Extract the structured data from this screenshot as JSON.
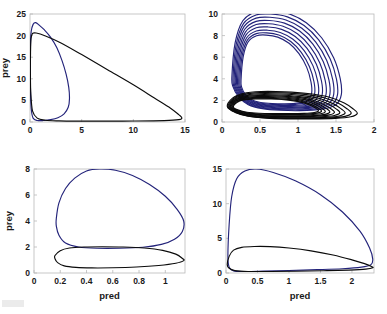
{
  "figure": {
    "title": "",
    "background_color": "#ffffff",
    "blue_color": "#23237a",
    "black_color": "#0b0b0b",
    "axis_color": "#b9b9b9",
    "panel_count": 4,
    "layout": "2x2 grid of predator-prey phase portraits"
  },
  "chart_data": [
    {
      "id": "panel-top-left",
      "type": "line",
      "title": "",
      "xlabel": "",
      "ylabel": "prey",
      "xlim": [
        0,
        15
      ],
      "ylim": [
        0,
        25
      ],
      "xticks": [
        0,
        5,
        10,
        15
      ],
      "xticklabels": [
        "0",
        "5",
        "10",
        "15"
      ],
      "yticks": [
        0,
        5,
        10,
        15,
        20,
        25
      ],
      "yticklabels": [
        "0",
        "5",
        "10",
        "15",
        "20",
        "25"
      ],
      "grid": false,
      "legend": null,
      "series": [
        {
          "name": "blue-orbit",
          "color": "#23237a",
          "description": "narrow tall limit cycle peaking near prey=23 at pred=0.5, extending right to pred~3.8 near prey=3",
          "points": [
            [
              0.05,
              18.5
            ],
            [
              0.12,
              21.0
            ],
            [
              0.3,
              22.6
            ],
            [
              0.55,
              23.0
            ],
            [
              0.9,
              22.4
            ],
            [
              1.4,
              21.3
            ],
            [
              2.0,
              19.6
            ],
            [
              2.6,
              17.2
            ],
            [
              3.1,
              14.2
            ],
            [
              3.5,
              11.0
            ],
            [
              3.75,
              8.0
            ],
            [
              3.82,
              5.4
            ],
            [
              3.7,
              3.4
            ],
            [
              3.3,
              1.9
            ],
            [
              2.7,
              1.0
            ],
            [
              2.0,
              0.55
            ],
            [
              1.3,
              0.35
            ],
            [
              0.7,
              0.35
            ],
            [
              0.3,
              0.9
            ],
            [
              0.12,
              3.0
            ],
            [
              0.05,
              7.0
            ],
            [
              0.03,
              12.0
            ],
            [
              0.05,
              18.5
            ]
          ]
        },
        {
          "name": "black-orbit",
          "color": "#0b0b0b",
          "description": "wide flat limit cycle reaching pred=14.7 near prey=1, upper branch declines linearly from prey=20.6 at pred=0 to prey=1 at pred=14.7",
          "points": [
            [
              0.05,
              16.0
            ],
            [
              0.1,
              19.3
            ],
            [
              0.25,
              20.5
            ],
            [
              0.6,
              20.6
            ],
            [
              1.5,
              19.9
            ],
            [
              3.0,
              18.3
            ],
            [
              5.0,
              15.6
            ],
            [
              7.5,
              12.1
            ],
            [
              10.0,
              8.6
            ],
            [
              12.0,
              5.6
            ],
            [
              13.6,
              3.2
            ],
            [
              14.4,
              1.7
            ],
            [
              14.7,
              0.95
            ],
            [
              14.4,
              0.55
            ],
            [
              13.0,
              0.32
            ],
            [
              10.0,
              0.22
            ],
            [
              7.0,
              0.2
            ],
            [
              4.5,
              0.2
            ],
            [
              2.8,
              0.25
            ],
            [
              1.5,
              0.4
            ],
            [
              0.7,
              0.9
            ],
            [
              0.25,
              2.5
            ],
            [
              0.08,
              6.5
            ],
            [
              0.04,
              11.0
            ],
            [
              0.05,
              16.0
            ]
          ]
        }
      ]
    },
    {
      "id": "panel-top-right",
      "type": "line",
      "title": "",
      "xlabel": "",
      "ylabel": "",
      "xlim": [
        0,
        2
      ],
      "ylim": [
        0,
        10
      ],
      "xticks": [
        0,
        0.5,
        1,
        1.5,
        2
      ],
      "xticklabels": [
        "0",
        "0.5",
        "1",
        "1.5",
        "2"
      ],
      "yticks": [
        0,
        2,
        4,
        6,
        8,
        10
      ],
      "yticklabels": [
        "0",
        "2",
        "4",
        "6",
        "8",
        "10"
      ],
      "grid": false,
      "legend": null,
      "note": "transient spiral: many nested orbits converging; blue family large amplitude (prey up to ~10.3), black family small amplitude (prey 0.3-2.8)",
      "series": [
        {
          "name": "blue-spiral-family",
          "color": "#23237a",
          "orbit_count": 9,
          "description": "nested loops shrinking inward, outermost peaks prey=10.3 at pred=0.55, rightmost pred=1.55",
          "orbits": [
            {
              "peak_prey": 10.3,
              "min_prey": 1.05,
              "left_pred": 0.13,
              "right_pred": 1.57
            },
            {
              "peak_prey": 10.0,
              "min_prey": 1.12,
              "left_pred": 0.145,
              "right_pred": 1.52
            },
            {
              "peak_prey": 9.7,
              "min_prey": 1.2,
              "left_pred": 0.16,
              "right_pred": 1.47
            },
            {
              "peak_prey": 9.4,
              "min_prey": 1.28,
              "left_pred": 0.175,
              "right_pred": 1.42
            },
            {
              "peak_prey": 9.1,
              "min_prey": 1.36,
              "left_pred": 0.19,
              "right_pred": 1.37
            },
            {
              "peak_prey": 8.8,
              "min_prey": 1.44,
              "left_pred": 0.205,
              "right_pred": 1.32
            },
            {
              "peak_prey": 8.5,
              "min_prey": 1.52,
              "left_pred": 0.22,
              "right_pred": 1.27
            },
            {
              "peak_prey": 8.25,
              "min_prey": 1.6,
              "left_pred": 0.235,
              "right_pred": 1.22
            },
            {
              "peak_prey": 8.05,
              "min_prey": 1.68,
              "left_pred": 0.25,
              "right_pred": 1.18
            }
          ]
        },
        {
          "name": "black-spiral-family",
          "color": "#0b0b0b",
          "orbit_count": 9,
          "description": "flat nested loops, prey range 0.25 to 2.8, pred extends to 1.78",
          "orbits": [
            {
              "peak_prey": 2.82,
              "min_prey": 0.28,
              "left_pred": 0.07,
              "right_pred": 1.78
            },
            {
              "peak_prey": 2.72,
              "min_prey": 0.33,
              "left_pred": 0.08,
              "right_pred": 1.7
            },
            {
              "peak_prey": 2.62,
              "min_prey": 0.38,
              "left_pred": 0.09,
              "right_pred": 1.62
            },
            {
              "peak_prey": 2.52,
              "min_prey": 0.44,
              "left_pred": 0.1,
              "right_pred": 1.55
            },
            {
              "peak_prey": 2.44,
              "min_prey": 0.5,
              "left_pred": 0.11,
              "right_pred": 1.48
            },
            {
              "peak_prey": 2.36,
              "min_prey": 0.56,
              "left_pred": 0.12,
              "right_pred": 1.42
            },
            {
              "peak_prey": 2.28,
              "min_prey": 0.63,
              "left_pred": 0.13,
              "right_pred": 1.36
            },
            {
              "peak_prey": 2.2,
              "min_prey": 0.7,
              "left_pred": 0.14,
              "right_pred": 1.31
            },
            {
              "peak_prey": 2.14,
              "min_prey": 0.77,
              "left_pred": 0.15,
              "right_pred": 1.27
            }
          ]
        }
      ]
    },
    {
      "id": "panel-bottom-left",
      "type": "line",
      "title": "",
      "xlabel": "pred",
      "ylabel": "prey",
      "xlim": [
        0,
        1.15
      ],
      "ylim": [
        0,
        8
      ],
      "xticks": [
        0,
        0.2,
        0.4,
        0.6,
        0.8,
        1
      ],
      "xticklabels": [
        "0",
        "0.2",
        "0.4",
        "0.6",
        "0.8",
        "1"
      ],
      "yticks": [
        0,
        2,
        4,
        6,
        8
      ],
      "yticklabels": [
        "0",
        "2",
        "4",
        "6",
        "8"
      ],
      "grid": false,
      "legend": null,
      "series": [
        {
          "name": "blue-orbit",
          "color": "#23237a",
          "description": "large rounded cycle peaking prey=8 at pred=0.5, spanning pred 0.17 to 1.14",
          "points": [
            [
              0.17,
              4.2
            ],
            [
              0.19,
              5.4
            ],
            [
              0.24,
              6.5
            ],
            [
              0.31,
              7.3
            ],
            [
              0.4,
              7.85
            ],
            [
              0.5,
              8.0
            ],
            [
              0.62,
              7.9
            ],
            [
              0.75,
              7.5
            ],
            [
              0.88,
              6.8
            ],
            [
              1.0,
              5.9
            ],
            [
              1.09,
              4.9
            ],
            [
              1.14,
              4.0
            ],
            [
              1.13,
              3.2
            ],
            [
              1.07,
              2.6
            ],
            [
              0.97,
              2.2
            ],
            [
              0.83,
              1.98
            ],
            [
              0.65,
              1.9
            ],
            [
              0.48,
              1.9
            ],
            [
              0.34,
              2.0
            ],
            [
              0.24,
              2.3
            ],
            [
              0.19,
              2.9
            ],
            [
              0.17,
              3.6
            ],
            [
              0.17,
              4.2
            ]
          ]
        },
        {
          "name": "black-orbit",
          "color": "#0b0b0b",
          "description": "flat lens-shaped cycle, prey between 0.4 and 2.0, pred 0.16 to 1.14",
          "points": [
            [
              0.16,
              1.35
            ],
            [
              0.2,
              1.72
            ],
            [
              0.27,
              1.92
            ],
            [
              0.38,
              2.0
            ],
            [
              0.52,
              2.02
            ],
            [
              0.68,
              2.0
            ],
            [
              0.84,
              1.92
            ],
            [
              0.98,
              1.74
            ],
            [
              1.08,
              1.45
            ],
            [
              1.13,
              1.12
            ],
            [
              1.14,
              0.95
            ],
            [
              1.08,
              0.75
            ],
            [
              0.95,
              0.58
            ],
            [
              0.78,
              0.46
            ],
            [
              0.6,
              0.4
            ],
            [
              0.44,
              0.39
            ],
            [
              0.32,
              0.43
            ],
            [
              0.23,
              0.55
            ],
            [
              0.18,
              0.8
            ],
            [
              0.16,
              1.1
            ],
            [
              0.16,
              1.35
            ]
          ]
        }
      ]
    },
    {
      "id": "panel-bottom-right",
      "type": "line",
      "title": "",
      "xlabel": "pred",
      "ylabel": "",
      "xlim": [
        0,
        2.35
      ],
      "ylim": [
        0,
        15
      ],
      "xticks": [
        0,
        0.5,
        1,
        1.5,
        2
      ],
      "xticklabels": [
        "0",
        "0.5",
        "1",
        "1.5",
        "2"
      ],
      "yticks": [
        0,
        5,
        10,
        15
      ],
      "yticklabels": [
        "0",
        "5",
        "10",
        "15"
      ],
      "grid": false,
      "legend": null,
      "series": [
        {
          "name": "blue-orbit",
          "color": "#23237a",
          "description": "large cycle peaking prey=15 at pred=0.5, right tip at pred=2.33, steep left wall at pred~0.03",
          "points": [
            [
              0.03,
              2.4
            ],
            [
              0.05,
              7.0
            ],
            [
              0.09,
              11.0
            ],
            [
              0.17,
              13.6
            ],
            [
              0.3,
              14.7
            ],
            [
              0.48,
              15.0
            ],
            [
              0.75,
              14.5
            ],
            [
              1.1,
              13.3
            ],
            [
              1.5,
              11.3
            ],
            [
              1.85,
              8.8
            ],
            [
              2.13,
              6.0
            ],
            [
              2.28,
              3.6
            ],
            [
              2.33,
              2.0
            ],
            [
              2.3,
              1.2
            ],
            [
              2.15,
              0.85
            ],
            [
              1.85,
              0.62
            ],
            [
              1.45,
              0.48
            ],
            [
              1.0,
              0.36
            ],
            [
              0.6,
              0.27
            ],
            [
              0.3,
              0.22
            ],
            [
              0.12,
              0.3
            ],
            [
              0.05,
              0.85
            ],
            [
              0.03,
              2.4
            ]
          ]
        },
        {
          "name": "black-orbit",
          "color": "#0b0b0b",
          "description": "flat cycle peaking prey=3.8 around pred=0.6, extending to pred=2.33",
          "points": [
            [
              0.02,
              1.2
            ],
            [
              0.05,
              2.4
            ],
            [
              0.12,
              3.3
            ],
            [
              0.25,
              3.7
            ],
            [
              0.45,
              3.82
            ],
            [
              0.7,
              3.8
            ],
            [
              1.0,
              3.6
            ],
            [
              1.35,
              3.2
            ],
            [
              1.7,
              2.6
            ],
            [
              2.0,
              1.9
            ],
            [
              2.2,
              1.35
            ],
            [
              2.31,
              0.95
            ],
            [
              2.33,
              0.75
            ],
            [
              2.22,
              0.55
            ],
            [
              1.95,
              0.42
            ],
            [
              1.55,
              0.33
            ],
            [
              1.1,
              0.26
            ],
            [
              0.7,
              0.22
            ],
            [
              0.35,
              0.22
            ],
            [
              0.14,
              0.35
            ],
            [
              0.05,
              0.68
            ],
            [
              0.02,
              1.2
            ]
          ]
        }
      ]
    }
  ]
}
